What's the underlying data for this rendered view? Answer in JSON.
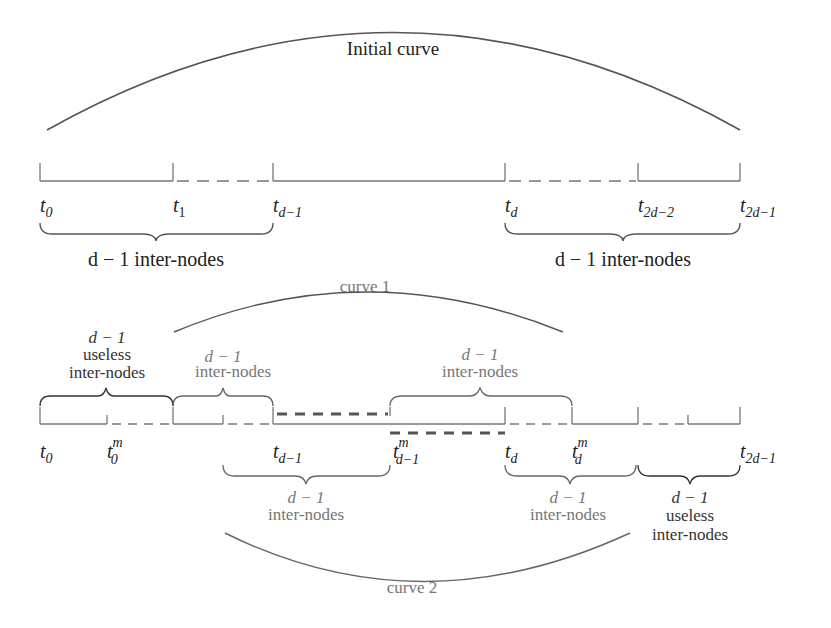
{
  "diagram": {
    "colors": {
      "line": "#555555",
      "text": "#222222",
      "muted_text": "#777777",
      "background": "#ffffff"
    },
    "top": {
      "curve_label": "Initial curve",
      "nodes": [
        {
          "base": "t",
          "sub": "0",
          "sup": ""
        },
        {
          "base": "t",
          "sub": "1",
          "sup": ""
        },
        {
          "base": "t",
          "sub": "d−1",
          "sup": ""
        },
        {
          "base": "t",
          "sub": "d",
          "sup": ""
        },
        {
          "base": "t",
          "sub": "2d−2",
          "sup": ""
        },
        {
          "base": "t",
          "sub": "2d−1",
          "sup": ""
        }
      ],
      "brace_left_label": "d − 1 inter-nodes",
      "brace_right_label": "d − 1 inter-nodes"
    },
    "bottom": {
      "curve1_label": "curve 1",
      "curve2_label": "curve 2",
      "nodes": [
        {
          "base": "t",
          "sub": "0",
          "sup": ""
        },
        {
          "base": "t",
          "sub": "0",
          "sup": "m"
        },
        {
          "base": "t",
          "sub": "d−1",
          "sup": ""
        },
        {
          "base": "t",
          "sub": "d−1",
          "sup": "m"
        },
        {
          "base": "t",
          "sub": "d",
          "sup": ""
        },
        {
          "base": "t",
          "sub": "d",
          "sup": "m"
        },
        {
          "base": "t",
          "sub": "2d−1",
          "sup": ""
        }
      ],
      "braces_above": [
        {
          "line1": "d − 1",
          "line2": "useless",
          "line3": "inter-nodes"
        },
        {
          "line1": "d − 1",
          "line2": "inter-nodes"
        },
        {
          "line1": "d − 1",
          "line2": "inter-nodes"
        }
      ],
      "braces_below": [
        {
          "line1": "d − 1",
          "line2": "inter-nodes"
        },
        {
          "line1": "d − 1",
          "line2": "inter-nodes"
        },
        {
          "line1": "d − 1",
          "line2": "useless",
          "line3": "inter-nodes"
        }
      ]
    }
  }
}
